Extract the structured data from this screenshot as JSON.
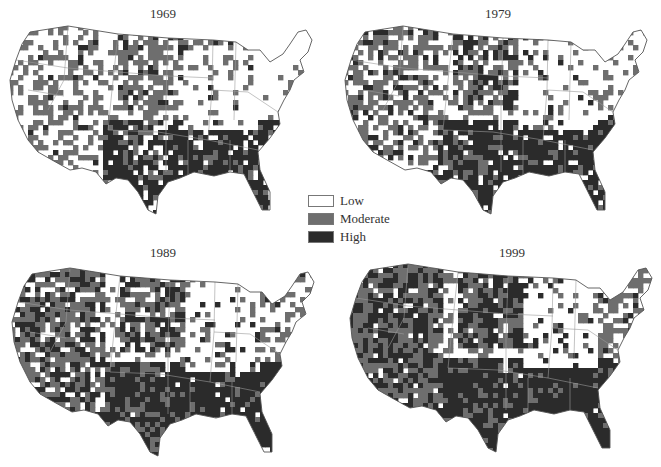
{
  "figure": {
    "panels": [
      {
        "year": "1969",
        "title_x": 133,
        "title_y": 6,
        "map_x": 8,
        "map_y": 20,
        "map_w": 308,
        "map_h": 194
      },
      {
        "year": "1979",
        "title_x": 468,
        "title_y": 6,
        "map_x": 343,
        "map_y": 20,
        "map_w": 308,
        "map_h": 194
      },
      {
        "year": "1989",
        "title_x": 133,
        "title_y": 245,
        "map_x": 10,
        "map_y": 262,
        "map_w": 308,
        "map_h": 194
      },
      {
        "year": "1999",
        "title_x": 482,
        "title_y": 245,
        "map_x": 358,
        "map_y": 258,
        "map_w": 308,
        "map_h": 194
      }
    ],
    "legend": {
      "items": [
        {
          "label": "Low",
          "color": "#ffffff"
        },
        {
          "label": "Moderate",
          "color": "#6e6e6e"
        },
        {
          "label": "High",
          "color": "#2b2b2b"
        }
      ]
    }
  },
  "chart_data": {
    "type": "choropleth",
    "geography": "Contiguous United States, county level",
    "categories": [
      "Low",
      "Moderate",
      "High"
    ],
    "colors": {
      "Low": "#ffffff",
      "Moderate": "#6e6e6e",
      "High": "#2b2b2b"
    },
    "maps": [
      {
        "title": "1969",
        "description": "High concentrated in the South (Southeast, Mississippi Delta, Texas, Oklahoma, Southwest/New Mexico-Arizona border, Appalachia); Moderate scattered across Great Plains, Mountain West, California Central Valley; Low across Northeast, Midwest, Pacific Northwest, Nevada"
      },
      {
        "title": "1979",
        "description": "High across the South and expanding into Northern Plains (Dakotas), Southwest (Arizona, New Mexico); Moderate in California, Oregon, Maine, Mountain West; Low in Wyoming, Midwest, Northeast"
      },
      {
        "title": "1989",
        "description": "High dominates the South, Texas, Southwest, Appalachia, and Northern Plains; Moderate widespread in West and Great Lakes; Low in Midwest corn belt and parts of Mountain West"
      },
      {
        "title": "1999",
        "description": "High dominates South, Southwest, California, Northern Rockies, and Northern Plains; Moderate in Pacific Northwest, Northeast, Maine; Low mainly in Upper Midwest and Ohio Valley"
      }
    ],
    "legend_position": "center",
    "grid": false
  }
}
